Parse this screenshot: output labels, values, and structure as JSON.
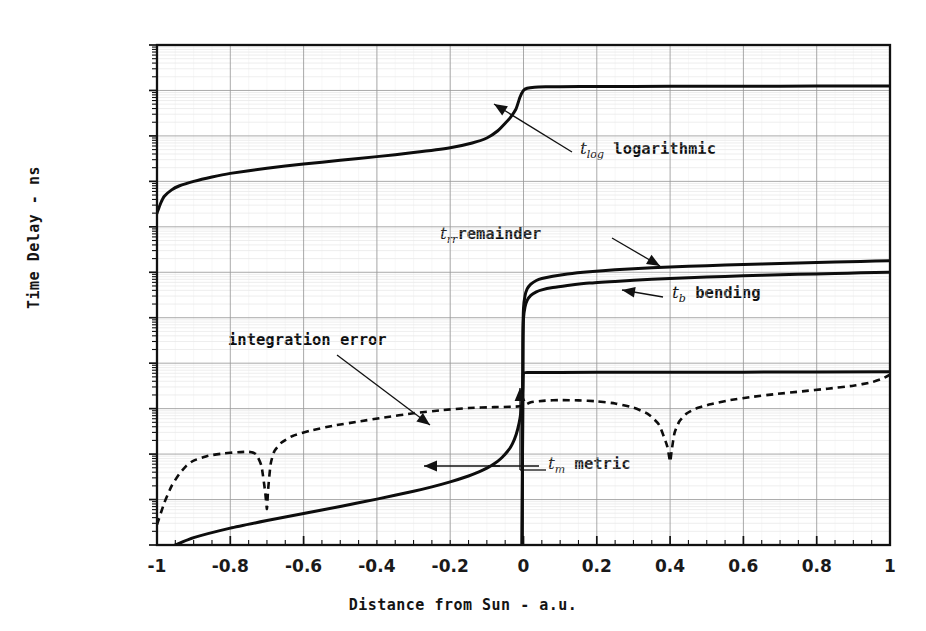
{
  "axes": {
    "xlabel": "Distance from Sun - a.u.",
    "ylabel": "Time Delay - ns",
    "xticks": [
      "-1",
      "-0.8",
      "-0.6",
      "-0.4",
      "-0.2",
      "0",
      "0.2",
      "0.4",
      "0.6",
      "0.8",
      "1"
    ],
    "xtickvals": [
      -1,
      -0.8,
      -0.6,
      -0.4,
      -0.2,
      0,
      0.2,
      0.4,
      0.6,
      0.8,
      1
    ],
    "yticks": [
      "1E+006",
      "100000",
      "10000",
      "1000",
      "100",
      "10",
      "1",
      "0.1",
      "0.01",
      "0.001",
      "0.0001",
      "1E-005"
    ],
    "ytickexp": [
      6,
      5,
      4,
      3,
      2,
      1,
      0,
      -1,
      -2,
      -3,
      -4,
      -5
    ]
  },
  "annotations": {
    "tlog": {
      "sym": "t",
      "sub": "log",
      "text": " logarithmic"
    },
    "trr": {
      "sym": "t",
      "sub": "rr",
      "text": "remainder"
    },
    "tb": {
      "sym": "t",
      "sub": "b",
      "text": " bending"
    },
    "tm": {
      "sym": "t",
      "sub": "m",
      "text": " metric"
    },
    "interr": {
      "text": "integration error"
    }
  },
  "colors": {
    "frame": "#111111",
    "curve": "#0d0d0d",
    "major_grid": "#9a9a9a",
    "minor_grid": "#d8d8d8",
    "text": "#141414"
  },
  "chart_data": {
    "type": "line",
    "title": "",
    "xlabel": "Distance from Sun - a.u.",
    "ylabel": "Time Delay - ns",
    "xlim": [
      -1,
      1
    ],
    "ylim": [
      1e-05,
      1000000.0
    ],
    "yscale": "log",
    "xscale": "linear",
    "grid": true,
    "legend_position": "inline-annotations",
    "series": [
      {
        "name": "t_log logarithmic",
        "label": "t(log) logarithmic",
        "style": "solid",
        "points": [
          [
            -1.0,
            200
          ],
          [
            -0.99,
            330
          ],
          [
            -0.98,
            470
          ],
          [
            -0.96,
            650
          ],
          [
            -0.94,
            790
          ],
          [
            -0.9,
            1000
          ],
          [
            -0.85,
            1250
          ],
          [
            -0.8,
            1500
          ],
          [
            -0.7,
            1950
          ],
          [
            -0.6,
            2400
          ],
          [
            -0.5,
            2900
          ],
          [
            -0.4,
            3500
          ],
          [
            -0.3,
            4300
          ],
          [
            -0.2,
            5500
          ],
          [
            -0.14,
            7000
          ],
          [
            -0.1,
            9000
          ],
          [
            -0.07,
            13000
          ],
          [
            -0.05,
            19000
          ],
          [
            -0.035,
            26000
          ],
          [
            -0.02,
            40000
          ],
          [
            -0.01,
            70000
          ],
          [
            0.0,
            100000
          ],
          [
            0.01,
            112000
          ],
          [
            0.03,
            118000
          ],
          [
            0.06,
            120000
          ],
          [
            0.1,
            121000
          ],
          [
            0.2,
            122000
          ],
          [
            0.4,
            123000
          ],
          [
            0.6,
            124000
          ],
          [
            0.8,
            125000
          ],
          [
            1.0,
            126000
          ]
        ]
      },
      {
        "name": "t_rr remainder",
        "label": "t(rr) remainder",
        "style": "solid",
        "points": [
          [
            -0.004,
            1e-05
          ],
          [
            -0.003,
            0.0004
          ],
          [
            -0.002,
            0.02
          ],
          [
            -0.0015,
            0.4
          ],
          [
            0.0,
            1.6
          ],
          [
            0.004,
            3.0
          ],
          [
            0.01,
            4.3
          ],
          [
            0.02,
            5.5
          ],
          [
            0.035,
            6.6
          ],
          [
            0.05,
            7.3
          ],
          [
            0.08,
            8.2
          ],
          [
            0.12,
            9.2
          ],
          [
            0.18,
            10.3
          ],
          [
            0.25,
            11.3
          ],
          [
            0.35,
            12.5
          ],
          [
            0.45,
            13.5
          ],
          [
            0.55,
            14.4
          ],
          [
            0.65,
            15.2
          ],
          [
            0.75,
            16.0
          ],
          [
            0.85,
            16.8
          ],
          [
            0.92,
            17.3
          ],
          [
            1.0,
            18.0
          ]
        ]
      },
      {
        "name": "t_b bending",
        "label": "t(b) bending",
        "style": "solid",
        "points": [
          [
            -0.004,
            1e-05
          ],
          [
            -0.003,
            0.0003
          ],
          [
            -0.002,
            0.015
          ],
          [
            -0.0015,
            0.25
          ],
          [
            0.0,
            0.95
          ],
          [
            0.004,
            1.7
          ],
          [
            0.01,
            2.4
          ],
          [
            0.02,
            3.1
          ],
          [
            0.035,
            3.7
          ],
          [
            0.05,
            4.1
          ],
          [
            0.08,
            4.6
          ],
          [
            0.12,
            5.1
          ],
          [
            0.18,
            5.8
          ],
          [
            0.25,
            6.3
          ],
          [
            0.35,
            7.0
          ],
          [
            0.45,
            7.6
          ],
          [
            0.55,
            8.1
          ],
          [
            0.65,
            8.6
          ],
          [
            0.75,
            9.0
          ],
          [
            0.85,
            9.4
          ],
          [
            0.92,
            9.7
          ],
          [
            1.0,
            10.0
          ]
        ]
      },
      {
        "name": "t_m metric",
        "label": "t(m) metric",
        "style": "solid",
        "points": [
          [
            -0.95,
            1e-05
          ],
          [
            -0.9,
            1.45e-05
          ],
          [
            -0.8,
            2.35e-05
          ],
          [
            -0.7,
            3.45e-05
          ],
          [
            -0.6,
            4.95e-05
          ],
          [
            -0.5,
            7.05e-05
          ],
          [
            -0.4,
            0.000102
          ],
          [
            -0.3,
            0.000152
          ],
          [
            -0.25,
            0.00019
          ],
          [
            -0.2,
            0.000245
          ],
          [
            -0.15,
            0.00033
          ],
          [
            -0.12,
            0.00041
          ],
          [
            -0.1,
            0.00049
          ],
          [
            -0.08,
            0.00061
          ],
          [
            -0.06,
            0.00082
          ],
          [
            -0.04,
            0.00125
          ],
          [
            -0.03,
            0.0017
          ],
          [
            -0.02,
            0.0027
          ],
          [
            -0.012,
            0.0048
          ],
          [
            -0.007,
            0.0085
          ],
          [
            -0.004,
            0.0145
          ],
          [
            -0.002,
            0.028
          ],
          [
            0.0,
            0.06
          ],
          [
            0.02,
            0.062
          ],
          [
            0.1,
            0.0625
          ],
          [
            0.3,
            0.063
          ],
          [
            0.6,
            0.0635
          ],
          [
            1.0,
            0.065
          ]
        ]
      },
      {
        "name": "integration error",
        "label": "integration error",
        "style": "dashed",
        "points": [
          [
            -1.0,
            2.8e-05
          ],
          [
            -0.98,
            8.5e-05
          ],
          [
            -0.96,
            0.0002
          ],
          [
            -0.94,
            0.00036
          ],
          [
            -0.92,
            0.00055
          ],
          [
            -0.9,
            0.00072
          ],
          [
            -0.86,
            0.00092
          ],
          [
            -0.82,
            0.00103
          ],
          [
            -0.78,
            0.0011
          ],
          [
            -0.75,
            0.00112
          ],
          [
            -0.73,
            0.001
          ],
          [
            -0.715,
            0.00055
          ],
          [
            -0.705,
            0.00015
          ],
          [
            -0.7,
            6.2e-05
          ],
          [
            -0.697,
            0.00016
          ],
          [
            -0.69,
            0.0006
          ],
          [
            -0.68,
            0.00115
          ],
          [
            -0.66,
            0.0018
          ],
          [
            -0.63,
            0.0025
          ],
          [
            -0.58,
            0.0033
          ],
          [
            -0.52,
            0.0042
          ],
          [
            -0.45,
            0.0052
          ],
          [
            -0.38,
            0.0064
          ],
          [
            -0.3,
            0.0079
          ],
          [
            -0.22,
            0.0093
          ],
          [
            -0.15,
            0.0103
          ],
          [
            -0.08,
            0.0108
          ],
          [
            -0.03,
            0.011
          ],
          [
            0.0,
            0.0115
          ],
          [
            0.02,
            0.0138
          ],
          [
            0.06,
            0.015
          ],
          [
            0.1,
            0.0154
          ],
          [
            0.15,
            0.0152
          ],
          [
            0.2,
            0.0145
          ],
          [
            0.25,
            0.013
          ],
          [
            0.3,
            0.0105
          ],
          [
            0.34,
            0.0076
          ],
          [
            0.37,
            0.0044
          ],
          [
            0.392,
            0.0015
          ],
          [
            0.4,
            0.00068
          ],
          [
            0.404,
            0.00115
          ],
          [
            0.412,
            0.0029
          ],
          [
            0.425,
            0.0052
          ],
          [
            0.445,
            0.0078
          ],
          [
            0.47,
            0.01
          ],
          [
            0.51,
            0.0125
          ],
          [
            0.56,
            0.0152
          ],
          [
            0.62,
            0.018
          ],
          [
            0.69,
            0.021
          ],
          [
            0.76,
            0.024
          ],
          [
            0.83,
            0.0275
          ],
          [
            0.9,
            0.032
          ],
          [
            0.95,
            0.038
          ],
          [
            0.98,
            0.046
          ],
          [
            1.0,
            0.056
          ]
        ]
      }
    ]
  }
}
